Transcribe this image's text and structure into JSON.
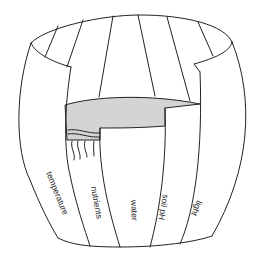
{
  "diagram": {
    "colors": {
      "stroke": "#222222",
      "water": "#d4d4d4",
      "background": "#ffffff"
    },
    "staves": [
      {
        "label": "temperature"
      },
      {
        "label": "nutrients"
      },
      {
        "label": "water"
      },
      {
        "label": "soil pH"
      },
      {
        "label": "light"
      }
    ],
    "water_label": "",
    "icons": {
      "leak": "water-drip-icon"
    }
  }
}
